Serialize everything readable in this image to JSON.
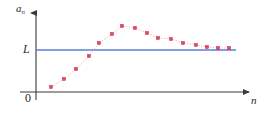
{
  "figure": {
    "kind": "sequence-convergence-plot",
    "background_color": "#ffffff"
  },
  "labels": {
    "y_axis_main": "a",
    "y_axis_subscript": "n",
    "limit": "L",
    "origin": "0",
    "x_axis": "n"
  },
  "colors": {
    "axis": "#3a3a3a",
    "limit_line": "#5b7fd4",
    "data_point_fill": "#e8455f",
    "data_point_stroke": "#c01b38",
    "connector": "#f2a8b6"
  },
  "chart_data": {
    "type": "scatter",
    "title": "",
    "xlabel": "n",
    "ylabel": "a_n",
    "grid": false,
    "legend": null,
    "annotations": [
      {
        "text": "L",
        "kind": "horizontal-asymptote-label",
        "y": 50
      },
      {
        "text": "0",
        "kind": "origin-label"
      }
    ],
    "reference_lines": [
      {
        "orientation": "horizontal",
        "label": "L",
        "y": 50,
        "x_start": 36,
        "x_end": 236,
        "color": "#5b7fd4"
      }
    ],
    "axes": {
      "x_axis_y": 92,
      "y_axis_x": 36,
      "x_start": 20,
      "x_end": 252,
      "y_top": 10,
      "y_bottom": 100,
      "arrows": [
        "x-right",
        "y-up"
      ]
    },
    "series": [
      {
        "name": "a_n",
        "connector": "dotted",
        "points": [
          {
            "x": 51,
            "y": 87
          },
          {
            "x": 64,
            "y": 79
          },
          {
            "x": 76,
            "y": 69
          },
          {
            "x": 89,
            "y": 56
          },
          {
            "x": 99,
            "y": 43
          },
          {
            "x": 112,
            "y": 34
          },
          {
            "x": 122,
            "y": 26
          },
          {
            "x": 135,
            "y": 28
          },
          {
            "x": 147,
            "y": 33
          },
          {
            "x": 158,
            "y": 38
          },
          {
            "x": 171,
            "y": 39
          },
          {
            "x": 183,
            "y": 43
          },
          {
            "x": 196,
            "y": 45
          },
          {
            "x": 207,
            "y": 47
          },
          {
            "x": 218,
            "y": 48
          },
          {
            "x": 229,
            "y": 48
          }
        ]
      }
    ]
  }
}
